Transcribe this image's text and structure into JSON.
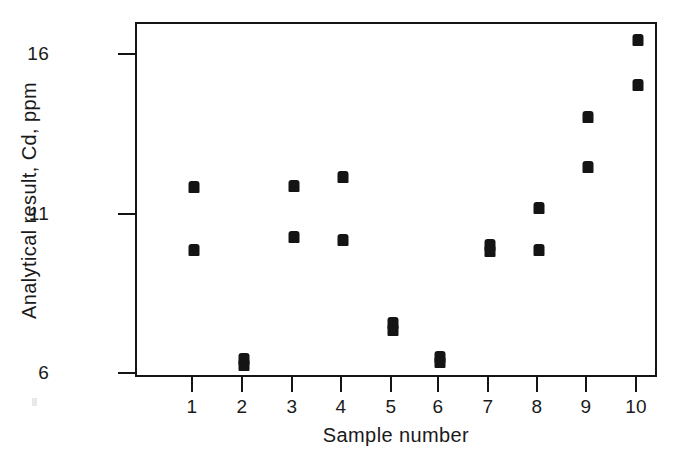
{
  "chart_data": {
    "type": "scatter",
    "title": "",
    "xlabel": "Sample number",
    "ylabel": "Analytical result, Cd, ppm",
    "xlim": [
      0.5,
      10.5
    ],
    "ylim": [
      5.2,
      16.6
    ],
    "grid": false,
    "legend": "none",
    "marker": "filled-square",
    "marker_color": "#141414",
    "x_tick_labels": [
      "1",
      "2",
      "3",
      "4",
      "5",
      "6",
      "7",
      "8",
      "9",
      "10"
    ],
    "x_tick_values": [
      1,
      2,
      3,
      4,
      5,
      6,
      7,
      8,
      9,
      10
    ],
    "y_tick_labels": [
      "16",
      "11",
      "6"
    ],
    "y_tick_values": [
      16,
      11,
      6
    ],
    "note": "Two replicate determinations per sample; for samples 5 and 7 the two replicates nearly coincide.",
    "series": [
      {
        "name": "Replicate 1",
        "values": [
          11.9,
          6.5,
          11.9,
          12.1,
          7.6,
          6.6,
          10.2,
          11.2,
          13.1,
          16.3
        ]
      },
      {
        "name": "Replicate 2",
        "values": [
          9.9,
          6.3,
          10.3,
          10.2,
          7.4,
          6.4,
          10.0,
          9.9,
          12.4,
          15.2
        ]
      }
    ],
    "points": [
      {
        "x": 1,
        "y": 11.9,
        "px": 192,
        "py": 185
      },
      {
        "x": 1,
        "y": 9.9,
        "px": 192,
        "py": 248
      },
      {
        "x": 2,
        "y": 6.5,
        "px": 242,
        "py": 357
      },
      {
        "x": 2,
        "y": 6.3,
        "px": 242,
        "py": 363
      },
      {
        "x": 3,
        "y": 11.9,
        "px": 292,
        "py": 184
      },
      {
        "x": 3,
        "y": 10.3,
        "px": 292,
        "py": 235
      },
      {
        "x": 4,
        "y": 12.1,
        "px": 341,
        "py": 175
      },
      {
        "x": 4,
        "y": 10.2,
        "px": 341,
        "py": 238
      },
      {
        "x": 5,
        "y": 7.6,
        "px": 391,
        "py": 321
      },
      {
        "x": 5,
        "y": 7.4,
        "px": 391,
        "py": 328
      },
      {
        "x": 6,
        "y": 6.6,
        "px": 438,
        "py": 355
      },
      {
        "x": 6,
        "y": 6.4,
        "px": 438,
        "py": 360
      },
      {
        "x": 7,
        "y": 10.2,
        "px": 488,
        "py": 243
      },
      {
        "x": 7,
        "y": 10.0,
        "px": 488,
        "py": 249
      },
      {
        "x": 8,
        "y": 11.2,
        "px": 537,
        "py": 206
      },
      {
        "x": 8,
        "y": 9.9,
        "px": 537,
        "py": 248
      },
      {
        "x": 9,
        "y": 13.1,
        "px": 586,
        "py": 115
      },
      {
        "x": 9,
        "y": 12.4,
        "px": 586,
        "py": 165
      },
      {
        "x": 10,
        "y": 16.3,
        "px": 636,
        "py": 38
      },
      {
        "x": 10,
        "y": 15.2,
        "px": 636,
        "py": 83
      }
    ],
    "x_tick_positions_px": [
      192,
      242,
      292,
      341,
      391,
      438,
      488,
      537,
      586,
      636
    ],
    "y_tick_positions_px": [
      53,
      213,
      372
    ]
  },
  "axes": {
    "y_title": "Analytical result, Cd, ppm",
    "x_title": "Sample number"
  }
}
